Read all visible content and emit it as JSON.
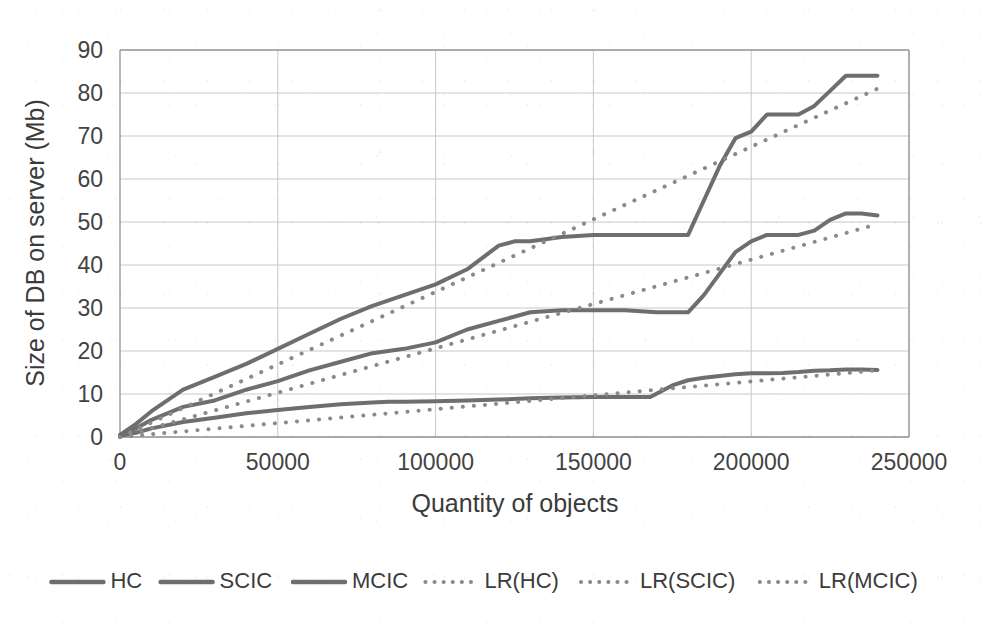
{
  "chart_data": {
    "type": "line",
    "title": "",
    "xlabel": "Quantity of objects",
    "ylabel": "Size of DB on server (Mb)",
    "xlim": [
      0,
      250000
    ],
    "ylim": [
      0,
      90
    ],
    "xticks": [
      "0",
      "50000",
      "100000",
      "150000",
      "200000",
      "250000"
    ],
    "xtick_values": [
      0,
      50000,
      100000,
      150000,
      200000,
      250000
    ],
    "yticks": [
      "0",
      "10",
      "20",
      "30",
      "40",
      "50",
      "60",
      "70",
      "80",
      "90"
    ],
    "ytick_values": [
      0,
      10,
      20,
      30,
      40,
      50,
      60,
      70,
      80,
      90
    ],
    "grid": true,
    "legend_position": "bottom",
    "line_color_solid": "#6e6e6e",
    "line_color_dotted": "#8a8a8a",
    "series": [
      {
        "name": "HC",
        "style": "solid",
        "x": [
          0,
          5000,
          10000,
          20000,
          30000,
          40000,
          50000,
          60000,
          70000,
          80000,
          90000,
          100000,
          110000,
          120000,
          125000,
          130000,
          140000,
          150000,
          160000,
          170000,
          180000,
          185000,
          190000,
          195000,
          200000,
          205000,
          210000,
          215000,
          220000,
          225000,
          230000,
          235000,
          240000
        ],
        "y": [
          0.5,
          3,
          6,
          11,
          14,
          17,
          20.5,
          24,
          27.5,
          30.5,
          33,
          35.5,
          39,
          44.5,
          45.5,
          45.5,
          46.5,
          47,
          47,
          47,
          47,
          55,
          63,
          69.5,
          71,
          75,
          75,
          75,
          77,
          80.5,
          84,
          84,
          84
        ]
      },
      {
        "name": "SCIC",
        "style": "solid",
        "x": [
          0,
          5000,
          10000,
          20000,
          30000,
          40000,
          50000,
          60000,
          70000,
          80000,
          90000,
          100000,
          110000,
          120000,
          130000,
          140000,
          150000,
          160000,
          170000,
          175000,
          180000,
          185000,
          190000,
          195000,
          200000,
          205000,
          210000,
          215000,
          220000,
          225000,
          230000,
          235000,
          240000
        ],
        "y": [
          0.4,
          2,
          4,
          7,
          8.5,
          11,
          13,
          15.5,
          17.5,
          19.5,
          20.5,
          22,
          25,
          27,
          29,
          29.5,
          29.5,
          29.5,
          29,
          29,
          29,
          33,
          38,
          43,
          45.5,
          47,
          47,
          47,
          48,
          50.5,
          52,
          52,
          51.5
        ]
      },
      {
        "name": "MCIC",
        "style": "solid",
        "x": [
          0,
          5000,
          10000,
          20000,
          30000,
          40000,
          50000,
          60000,
          70000,
          80000,
          85000,
          90000,
          100000,
          110000,
          120000,
          130000,
          140000,
          150000,
          160000,
          168000,
          175000,
          180000,
          185000,
          190000,
          195000,
          200000,
          205000,
          210000,
          215000,
          220000,
          225000,
          230000,
          235000,
          240000
        ],
        "y": [
          0.3,
          1,
          2,
          3.5,
          4.5,
          5.5,
          6.3,
          7,
          7.6,
          8,
          8.2,
          8.2,
          8.3,
          8.5,
          8.7,
          9,
          9.2,
          9.3,
          9.3,
          9.3,
          12,
          13.2,
          13.8,
          14.2,
          14.6,
          14.8,
          14.8,
          14.9,
          15.1,
          15.4,
          15.5,
          15.7,
          15.7,
          15.6
        ]
      },
      {
        "name": "LR(HC)",
        "style": "dotted",
        "x": [
          0,
          240000
        ],
        "y": [
          0,
          81
        ]
      },
      {
        "name": "LR(SCIC)",
        "style": "dotted",
        "x": [
          0,
          240000
        ],
        "y": [
          0,
          49.5
        ]
      },
      {
        "name": "LR(MCIC)",
        "style": "dotted",
        "x": [
          0,
          240000
        ],
        "y": [
          0,
          15.5
        ]
      }
    ],
    "legend": [
      {
        "label": "HC",
        "style": "solid"
      },
      {
        "label": "SCIC",
        "style": "solid"
      },
      {
        "label": "MCIC",
        "style": "solid"
      },
      {
        "label": "LR(HC)",
        "style": "dotted"
      },
      {
        "label": "LR(SCIC)",
        "style": "dotted"
      },
      {
        "label": "LR(MCIC)",
        "style": "dotted"
      }
    ]
  }
}
